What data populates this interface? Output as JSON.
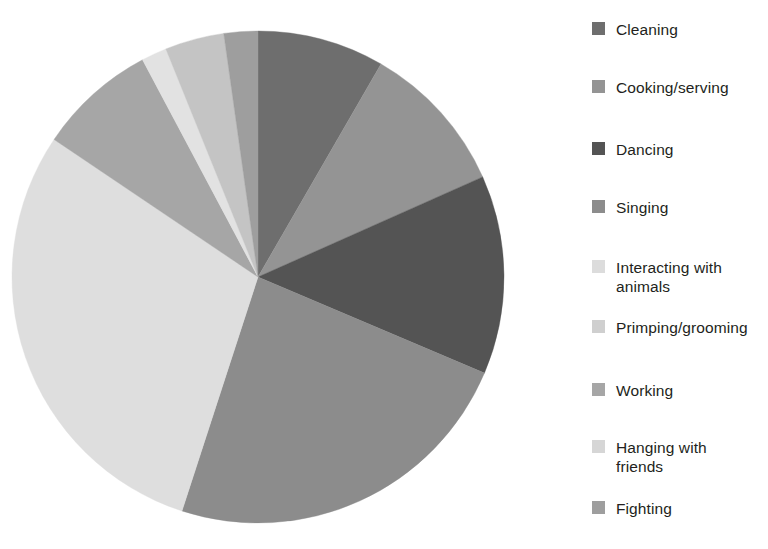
{
  "chart_data": {
    "type": "pie",
    "title": "",
    "subtitle": "",
    "xlabel": "",
    "ylabel": "",
    "grid": false,
    "legend_position": "right",
    "start_angle_deg": 0,
    "direction": "clockwise",
    "categories": [
      "Cleaning",
      "Cooking/serving",
      "Dancing",
      "Singing",
      "Interacting with animals",
      "Primping/grooming",
      "Working",
      "Hanging with friends",
      "Fighting"
    ],
    "values": [
      8.3,
      10.0,
      13.1,
      23.6,
      3.9,
      1.7,
      7.8,
      29.4,
      2.2
    ],
    "unit": "percent",
    "slices": [
      {
        "label": "Cleaning",
        "value": 8.3,
        "color": "#6e6e6e",
        "start_deg": 0.0,
        "end_deg": 30.0
      },
      {
        "label": "Cooking/serving",
        "value": 10.0,
        "color": "#949494",
        "start_deg": 30.0,
        "end_deg": 66.0
      },
      {
        "label": "Dancing",
        "value": 13.1,
        "color": "#545454",
        "start_deg": 66.0,
        "end_deg": 113.0
      },
      {
        "label": "Singing",
        "value": 23.6,
        "color": "#8c8c8c",
        "start_deg": 113.0,
        "end_deg": 198.0
      },
      {
        "label": "Hanging with friends",
        "value": 29.4,
        "color": "#dedede",
        "start_deg": 198.0,
        "end_deg": 304.0
      },
      {
        "label": "Working",
        "value": 7.8,
        "color": "#a6a6a6",
        "start_deg": 304.0,
        "end_deg": 332.0
      },
      {
        "label": "Primping/grooming",
        "value": 1.7,
        "color": "#e2e2e2",
        "start_deg": 332.0,
        "end_deg": 338.0
      },
      {
        "label": "Interacting with animals",
        "value": 3.9,
        "color": "#c4c4c4",
        "start_deg": 338.0,
        "end_deg": 352.0
      },
      {
        "label": "Fighting",
        "value": 2.2,
        "color": "#9e9e9e",
        "start_deg": 352.0,
        "end_deg": 360.0
      }
    ],
    "geometry": {
      "cx": 258,
      "cy": 277,
      "r": 246
    }
  },
  "legend": {
    "items": [
      {
        "label": "Cleaning",
        "color": "#6e6e6e",
        "swatch": "legend-swatch-cleaning",
        "y": 20
      },
      {
        "label": "Cooking/serving",
        "color": "#949494",
        "swatch": "legend-swatch-cooking",
        "y": 78
      },
      {
        "label": "Dancing",
        "color": "#545454",
        "swatch": "legend-swatch-dancing",
        "y": 140
      },
      {
        "label": "Singing",
        "color": "#8c8c8c",
        "swatch": "legend-swatch-singing",
        "y": 198
      },
      {
        "label": "Interacting with\nanimals",
        "color": "#dcdcdc",
        "swatch": "legend-swatch-animals",
        "y": 258
      },
      {
        "label": "Primping/grooming",
        "color": "#cfcfcf",
        "swatch": "legend-swatch-primping",
        "y": 318
      },
      {
        "label": "Working",
        "color": "#a6a6a6",
        "swatch": "legend-swatch-working",
        "y": 381
      },
      {
        "label": "Hanging with\nfriends",
        "color": "#d6d6d6",
        "swatch": "legend-swatch-hanging",
        "y": 438
      },
      {
        "label": "Fighting",
        "color": "#9e9e9e",
        "swatch": "legend-swatch-fighting",
        "y": 499
      }
    ]
  },
  "canvas": {
    "background": "#ffffff",
    "width": 768,
    "height": 549
  }
}
